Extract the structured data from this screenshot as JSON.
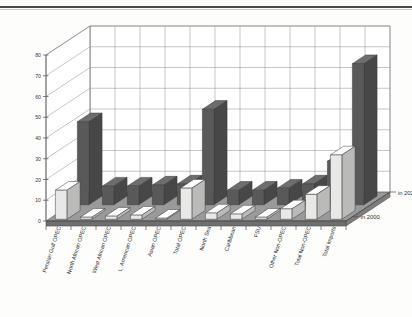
{
  "chart_data": {
    "type": "bar",
    "title": "",
    "subtitle": "",
    "xlabel": "",
    "ylabel": "",
    "ylim": [
      0,
      80
    ],
    "yticks": [
      0,
      10,
      20,
      30,
      40,
      50,
      60,
      70,
      80
    ],
    "grid": true,
    "three_d": true,
    "legend_position": "right-depth-axis",
    "categories": [
      "Persian Gulf OPEC",
      "North African OPEC",
      "West  African OPEC",
      "L.  American OPEC",
      "Asian   OPEC",
      "Total   OPEC",
      "North Sea",
      "Caribbean",
      "FSU",
      "Other Non-OPEC",
      "Total Non-OPEC",
      "Total Imports"
    ],
    "series": [
      {
        "name": "in 2000",
        "color": "#e8e8e6",
        "values": [
          14,
          1,
          1.5,
          2,
          0.5,
          15,
          3,
          2.5,
          1,
          5,
          12,
          31
        ]
      },
      {
        "name": "in 2020",
        "color": "#595959",
        "values": [
          40,
          9,
          9,
          9.5,
          10,
          46,
          7,
          7,
          8,
          10,
          21,
          68
        ]
      }
    ]
  },
  "axis": {
    "y_tick_labels": [
      "80",
      "70",
      "60",
      "50",
      "40",
      "30",
      "20",
      "10",
      "0"
    ]
  },
  "legend": {
    "back_label": "in 2020",
    "front_label": "in 2000"
  }
}
